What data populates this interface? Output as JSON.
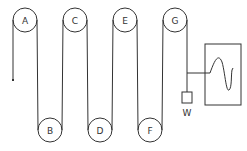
{
  "diagram": {
    "colors": {
      "line": "#333333",
      "background": "#ffffff"
    },
    "top_pulleys": [
      {
        "label": "A",
        "cx": 25,
        "cy": 20
      },
      {
        "label": "C",
        "cx": 75,
        "cy": 20
      },
      {
        "label": "E",
        "cx": 125,
        "cy": 20
      },
      {
        "label": "G",
        "cx": 175,
        "cy": 20
      }
    ],
    "bottom_pulleys": [
      {
        "label": "B",
        "cx": 50,
        "cy": 130
      },
      {
        "label": "D",
        "cx": 100,
        "cy": 130
      },
      {
        "label": "F",
        "cx": 150,
        "cy": 130
      }
    ],
    "weight": {
      "label": "W"
    },
    "trace_box": {
      "label": ""
    }
  }
}
